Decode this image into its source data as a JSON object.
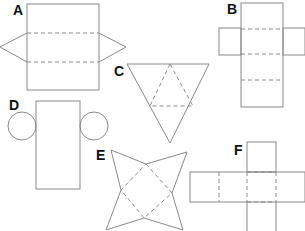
{
  "diagram": {
    "type": "geometric-nets",
    "stroke_color": "#8a8a8a",
    "label_color": "#111111",
    "nets": [
      {
        "label": "A",
        "shape": "rectangle with two side pentagonal flaps (triangular prism net)"
      },
      {
        "label": "B",
        "shape": "cross-shaped net (cuboid net)"
      },
      {
        "label": "C",
        "shape": "triangle subdivided into four triangles (tetrahedron net)"
      },
      {
        "label": "D",
        "shape": "rectangle with two circles (cylinder net)"
      },
      {
        "label": "E",
        "shape": "square with four triangular flaps (square pyramid net)"
      },
      {
        "label": "F",
        "shape": "cross-shaped net (cube/cuboid net)"
      }
    ]
  }
}
